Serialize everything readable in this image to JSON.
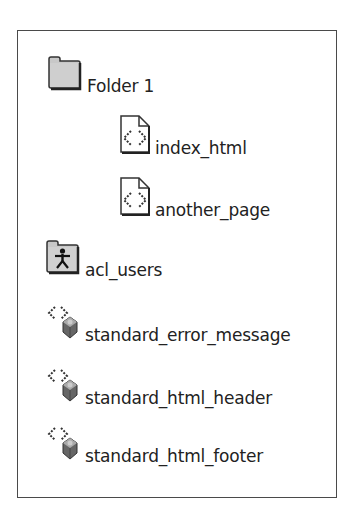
{
  "tree": {
    "items": [
      {
        "label": "Folder 1",
        "icon": "folder-icon",
        "indent": 0
      },
      {
        "label": "index_html",
        "icon": "dtml-document-icon",
        "indent": 1
      },
      {
        "label": "another_page",
        "icon": "dtml-document-icon",
        "indent": 1
      },
      {
        "label": "acl_users",
        "icon": "user-folder-icon",
        "indent": 0
      },
      {
        "label": "standard_error_message",
        "icon": "dtml-method-icon",
        "indent": 0
      },
      {
        "label": "standard_html_header",
        "icon": "dtml-method-icon",
        "indent": 0
      },
      {
        "label": "standard_html_footer",
        "icon": "dtml-method-icon",
        "indent": 0
      }
    ]
  },
  "colors": {
    "border": "#4a4a4a",
    "folder_fill": "#c8c8c8",
    "text": "#222222"
  }
}
